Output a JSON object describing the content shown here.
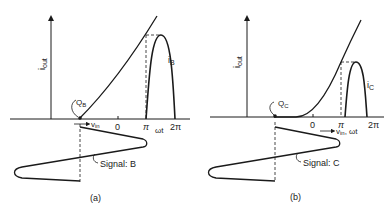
{
  "panels": [
    {
      "id": "a",
      "caption": "(a)",
      "y_axis_label": "i",
      "y_axis_sub": "out",
      "q_label": "Q",
      "q_sub": "B",
      "pulse_label": "i",
      "pulse_sub": "B",
      "vin_label": "v",
      "vin_sub": "in",
      "wt_label": "ωt",
      "ticks": [
        "0",
        "π",
        "2π"
      ],
      "signal_label": "Signal: B"
    },
    {
      "id": "b",
      "caption": "(b)",
      "y_axis_label": "i",
      "y_axis_sub": "out",
      "q_label": "Q",
      "q_sub": "C",
      "pulse_label": "i",
      "pulse_sub": "C",
      "vin_label": "v",
      "vin_sub": "in",
      "wt_label": ", ωt",
      "ticks": [
        "0",
        "π",
        "2π"
      ],
      "signal_label": "Signal: C"
    }
  ]
}
